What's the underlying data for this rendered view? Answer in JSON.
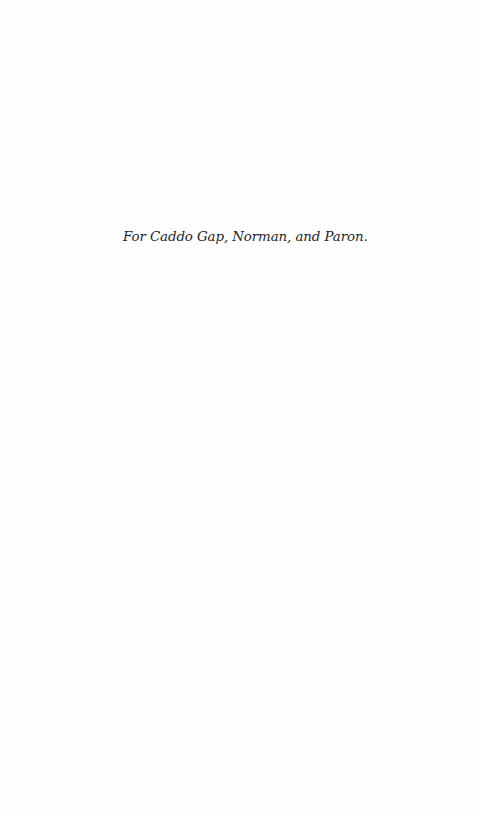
{
  "page": {
    "type": "dedication",
    "background_color": "#ffffff",
    "text_color": "#1f1f1f"
  },
  "dedication": {
    "text": "For Caddo Gap, Norman, and Paron."
  }
}
